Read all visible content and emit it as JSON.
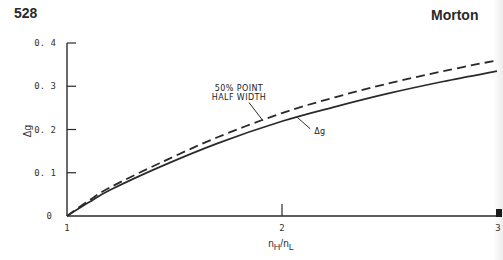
{
  "page": {
    "page_number": "528",
    "running_head": "Morton"
  },
  "chart_data": {
    "type": "line",
    "title": "",
    "xlabel": "n_H/n_L",
    "xlabel_display": "nH/nL",
    "ylabel": "Δg",
    "xlim": [
      1,
      3
    ],
    "ylim": [
      0,
      0.4
    ],
    "x_ticks": [
      {
        "value": 1,
        "label": "1"
      },
      {
        "value": 2,
        "label": "2"
      },
      {
        "value": 3,
        "label": "3"
      }
    ],
    "y_ticks": [
      {
        "value": 0,
        "label": "0"
      },
      {
        "value": 0.1,
        "label": "0. 1"
      },
      {
        "value": 0.2,
        "label": "0. 2"
      },
      {
        "value": 0.3,
        "label": "0. 3"
      },
      {
        "value": 0.4,
        "label": "0. 4"
      }
    ],
    "grid": false,
    "series": [
      {
        "name": "50% POINT HALF WIDTH",
        "style": "dashed",
        "color": "#2a2a2a",
        "x": [
          1.0,
          1.1,
          1.2,
          1.43,
          1.7,
          2.0,
          2.25,
          2.5,
          2.75,
          3.0
        ],
        "y": [
          0.0,
          0.035,
          0.066,
          0.122,
          0.182,
          0.238,
          0.275,
          0.307,
          0.335,
          0.36
        ]
      },
      {
        "name": "Δg",
        "style": "solid",
        "color": "#2a2a2a",
        "x": [
          1.0,
          1.1,
          1.2,
          1.43,
          1.7,
          2.0,
          2.25,
          2.5,
          2.75,
          3.0
        ],
        "y": [
          0.0,
          0.031,
          0.06,
          0.113,
          0.168,
          0.219,
          0.253,
          0.284,
          0.311,
          0.335
        ]
      }
    ],
    "annotations": [
      {
        "text_lines": [
          "50% POINT",
          "HALF WIDTH"
        ],
        "target_series": "50% POINT HALF WIDTH",
        "anchor_x": 1.92,
        "label_x": 1.8,
        "label_y": 0.29
      },
      {
        "text": "Δg",
        "target_series": "Δg",
        "anchor_x": 2.07,
        "label_x": 2.15,
        "label_y": 0.19
      }
    ]
  }
}
